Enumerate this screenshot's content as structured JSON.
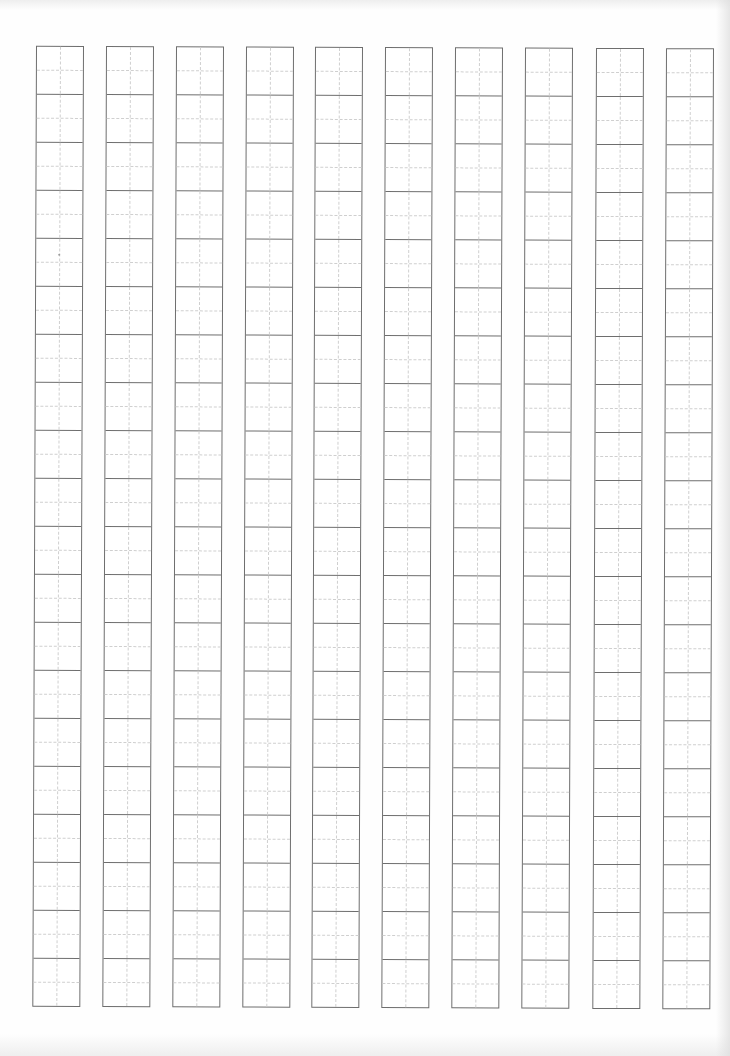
{
  "sheet": {
    "type": "tianzige-practice-grid",
    "columns": 10,
    "cells_per_column": 20,
    "column_lefts": [
      36,
      106,
      176,
      246,
      315,
      385,
      455,
      525,
      596,
      666
    ],
    "grid_top": 47,
    "cell_width": 46,
    "cell_height": 48,
    "colors": {
      "border": "#6e6e6e",
      "guide": "#cfcfcf",
      "paper": "#fefefe"
    }
  },
  "marks": [
    {
      "x": 59,
      "y": 255
    }
  ]
}
